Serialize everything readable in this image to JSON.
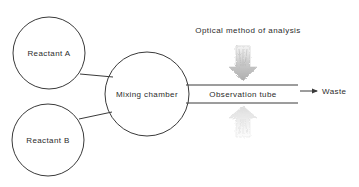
{
  "diagram": {
    "title_text_visible": false,
    "background_color": "#ffffff",
    "stroke_color": "#3a3a3a",
    "text_color": "#2b2b2b",
    "beam_color": "#9a9a9a",
    "nodes": [
      {
        "id": "reactant-a",
        "label": "Reactant A",
        "cx": 49,
        "cy": 53,
        "r": 36
      },
      {
        "id": "reactant-b",
        "label": "Reactant B",
        "cx": 48,
        "cy": 140,
        "r": 36
      },
      {
        "id": "mixing-chamber",
        "label": "Mixing chamber",
        "cx": 147,
        "cy": 94,
        "r": 42
      }
    ],
    "tube": {
      "label": "Observation tube",
      "x_start": 189,
      "x_end": 298,
      "y_top": 85,
      "y_bottom": 103,
      "label_x": 243,
      "label_y": 95
    },
    "outlet": {
      "label": "Waste",
      "arrow_x_start": 300,
      "arrow_x_end": 318,
      "arrow_y": 91,
      "label_x": 322,
      "label_y": 94
    },
    "beams": [
      {
        "id": "incident-beam",
        "direction": "down",
        "cx": 243,
        "y_top": 46,
        "y_bottom": 81,
        "opacity": 0.58
      },
      {
        "id": "transmitted-beam",
        "direction": "up",
        "cx": 243,
        "y_top": 106,
        "y_bottom": 137,
        "opacity": 0.34
      }
    ],
    "beam_caption": {
      "label": "Optical method of analysis",
      "x": 248,
      "y": 33
    },
    "connectors": [
      {
        "id": "a-to-chamber",
        "x1": 80,
        "y1": 74,
        "x2": 112,
        "y2": 76
      },
      {
        "id": "b-to-chamber",
        "x1": 79,
        "y1": 119,
        "x2": 111,
        "y2": 113
      }
    ]
  }
}
